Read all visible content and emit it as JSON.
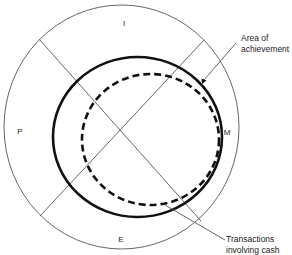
{
  "diagram": {
    "sectors": {
      "top": "I",
      "left": "P",
      "right": "M",
      "bottom": "E"
    },
    "callouts": {
      "area": {
        "line1": "Area of",
        "line2": "achievement"
      },
      "cash": {
        "line1": "Transactions",
        "line2": "involving cash"
      }
    },
    "colors": {
      "background": "#ffffff",
      "thin_line": "#555555",
      "thick_line": "#111111",
      "text": "#222222"
    }
  }
}
